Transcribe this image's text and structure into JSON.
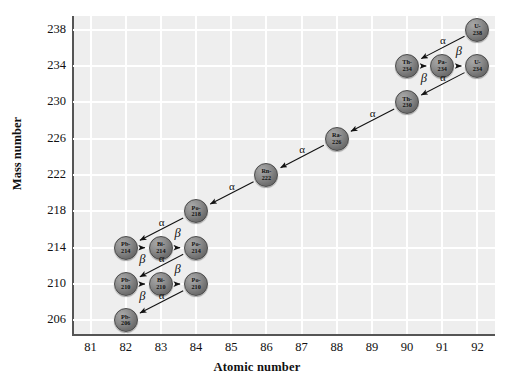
{
  "chart_data": {
    "type": "scatter",
    "title": "",
    "xlabel": "Atomic number",
    "ylabel": "Mass number",
    "xlim": [
      80.5,
      92.5
    ],
    "ylim": [
      204.5,
      239.5
    ],
    "xticks": [
      81,
      82,
      83,
      84,
      85,
      86,
      87,
      88,
      89,
      90,
      91,
      92
    ],
    "yticks": [
      206,
      210,
      214,
      218,
      222,
      226,
      230,
      234,
      238
    ],
    "grid": true,
    "legend": null,
    "plot_background": "#eeeeee",
    "gridline_color": "#ffffff",
    "node_color": "#7a7a7a",
    "nodes": [
      {
        "id": "U-238",
        "element": "U-",
        "mass": "238",
        "x": 92,
        "y": 238
      },
      {
        "id": "Th-234",
        "element": "Th-",
        "mass": "234",
        "x": 90,
        "y": 234
      },
      {
        "id": "Pa-234",
        "element": "Pa-",
        "mass": "234",
        "x": 91,
        "y": 234
      },
      {
        "id": "U-234",
        "element": "U-",
        "mass": "234",
        "x": 92,
        "y": 234
      },
      {
        "id": "Th-230",
        "element": "Th-",
        "mass": "230",
        "x": 90,
        "y": 230
      },
      {
        "id": "Ra-226",
        "element": "Ra-",
        "mass": "226",
        "x": 88,
        "y": 226
      },
      {
        "id": "Rn-222",
        "element": "Rn-",
        "mass": "222",
        "x": 86,
        "y": 222
      },
      {
        "id": "Po-218",
        "element": "Po-",
        "mass": "218",
        "x": 84,
        "y": 218
      },
      {
        "id": "Pb-214",
        "element": "Pb-",
        "mass": "214",
        "x": 82,
        "y": 214
      },
      {
        "id": "Bi-214",
        "element": "Bi-",
        "mass": "214",
        "x": 83,
        "y": 214
      },
      {
        "id": "Po-214",
        "element": "Po-",
        "mass": "214",
        "x": 84,
        "y": 214
      },
      {
        "id": "Pb-210",
        "element": "Pb-",
        "mass": "210",
        "x": 82,
        "y": 210
      },
      {
        "id": "Bi-210",
        "element": "Bi-",
        "mass": "210",
        "x": 83,
        "y": 210
      },
      {
        "id": "Po-210",
        "element": "Po-",
        "mass": "210",
        "x": 84,
        "y": 210
      },
      {
        "id": "Pb-206",
        "element": "Pb-",
        "mass": "206",
        "x": 82,
        "y": 206
      }
    ],
    "decays": [
      {
        "from": "U-238",
        "to": "Th-234",
        "type": "alpha",
        "label": "α",
        "label_x": 91.05,
        "label_y": 236.6
      },
      {
        "from": "Th-234",
        "to": "Pa-234",
        "type": "beta",
        "label": "β",
        "label_x": 90.5,
        "label_y": 232.6
      },
      {
        "from": "Pa-234",
        "to": "U-234",
        "type": "beta",
        "label": "β",
        "label_x": 91.5,
        "label_y": 235.5
      },
      {
        "from": "U-234",
        "to": "Th-230",
        "type": "alpha",
        "label": "α",
        "label_x": 91.05,
        "label_y": 232.6
      },
      {
        "from": "Th-230",
        "to": "Ra-226",
        "type": "alpha",
        "label": "α",
        "label_x": 89.05,
        "label_y": 228.6
      },
      {
        "from": "Ra-226",
        "to": "Rn-222",
        "type": "alpha",
        "label": "α",
        "label_x": 87.05,
        "label_y": 224.6
      },
      {
        "from": "Rn-222",
        "to": "Po-218",
        "type": "alpha",
        "label": "α",
        "label_x": 85.05,
        "label_y": 220.6
      },
      {
        "from": "Po-218",
        "to": "Pb-214",
        "type": "alpha",
        "label": "α",
        "label_x": 83.05,
        "label_y": 216.6
      },
      {
        "from": "Pb-214",
        "to": "Bi-214",
        "type": "beta",
        "label": "β",
        "label_x": 82.5,
        "label_y": 212.6
      },
      {
        "from": "Bi-214",
        "to": "Po-214",
        "type": "beta",
        "label": "β",
        "label_x": 83.5,
        "label_y": 215.5
      },
      {
        "from": "Po-214",
        "to": "Pb-210",
        "type": "alpha",
        "label": "α",
        "label_x": 83.05,
        "label_y": 212.6
      },
      {
        "from": "Pb-210",
        "to": "Bi-210",
        "type": "beta",
        "label": "β",
        "label_x": 82.5,
        "label_y": 208.6
      },
      {
        "from": "Bi-210",
        "to": "Po-210",
        "type": "beta",
        "label": "β",
        "label_x": 83.5,
        "label_y": 211.5
      },
      {
        "from": "Po-210",
        "to": "Pb-206",
        "type": "alpha",
        "label": "α",
        "label_x": 83.05,
        "label_y": 208.6
      }
    ]
  }
}
